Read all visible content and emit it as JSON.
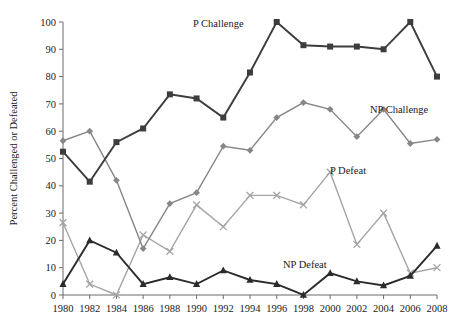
{
  "chart_data": {
    "type": "line",
    "title": "",
    "subtitle": "",
    "xlabel": "",
    "ylabel": "Percent Challenged or Defeated",
    "xlim": [
      1980,
      2008
    ],
    "ylim": [
      0,
      100
    ],
    "ytick_interval": 10,
    "grid": false,
    "legend_position": "inline-annotations",
    "categories": [
      1980,
      1982,
      1984,
      1986,
      1988,
      1990,
      1992,
      1994,
      1996,
      1998,
      2000,
      2002,
      2004,
      2006,
      2008
    ],
    "x": [
      1980,
      1982,
      1984,
      1986,
      1988,
      1990,
      1992,
      1994,
      1996,
      1998,
      2000,
      2002,
      2004,
      2006,
      2008
    ],
    "xtick_labels": [
      "1980",
      "1982",
      "1984",
      "1986",
      "1988",
      "1990",
      "1992",
      "1994",
      "1996",
      "1998",
      "2000",
      "2002",
      "2004",
      "2006",
      "2008"
    ],
    "ytick_labels": [
      "0",
      "10",
      "20",
      "30",
      "40",
      "50",
      "60",
      "70",
      "80",
      "90",
      "100"
    ],
    "ytick_values": [
      0,
      10,
      20,
      30,
      40,
      50,
      60,
      70,
      80,
      90,
      100
    ],
    "series": [
      {
        "name": "P Challenge",
        "label": "P Challenge",
        "color": "#3d3d3d",
        "marker": "square",
        "values": [
          52.5,
          41.5,
          56,
          61,
          73.5,
          72,
          65,
          81.5,
          100,
          91.5,
          91,
          91,
          90,
          100,
          80
        ]
      },
      {
        "name": "NP Challenge",
        "label": "NP Challenge",
        "color": "#878787",
        "marker": "diamond",
        "values": [
          56.5,
          60,
          42,
          17,
          33.5,
          37.5,
          54.5,
          53,
          65,
          70.5,
          68,
          58,
          68,
          55.5,
          57
        ]
      },
      {
        "name": "P Defeat",
        "label": "P Defeat",
        "color": "#a5a5a5",
        "marker": "cross",
        "values": [
          26.5,
          4,
          0,
          22,
          16,
          33,
          25,
          36.5,
          36.5,
          33,
          45,
          18.5,
          30,
          8,
          10
        ]
      },
      {
        "name": "NP Defeat",
        "label": "NP Defeat",
        "color": "#2b2b2b",
        "marker": "triangle",
        "values": [
          4,
          20,
          15.5,
          4,
          6.5,
          4,
          9,
          5.5,
          4,
          0,
          8,
          5,
          3.5,
          7,
          18
        ]
      }
    ],
    "annotations": [
      {
        "text": "P Challenge",
        "series": "P Challenge",
        "x_px": 193,
        "y_px": 27
      },
      {
        "text": "NP Challenge",
        "series": "NP Challenge",
        "x_px": 370,
        "y_px": 113
      },
      {
        "text": "P Defeat",
        "series": "P Defeat",
        "x_px": 330,
        "y_px": 174
      },
      {
        "text": "NP Defeat",
        "series": "NP Defeat",
        "x_px": 283,
        "y_px": 268
      }
    ]
  }
}
